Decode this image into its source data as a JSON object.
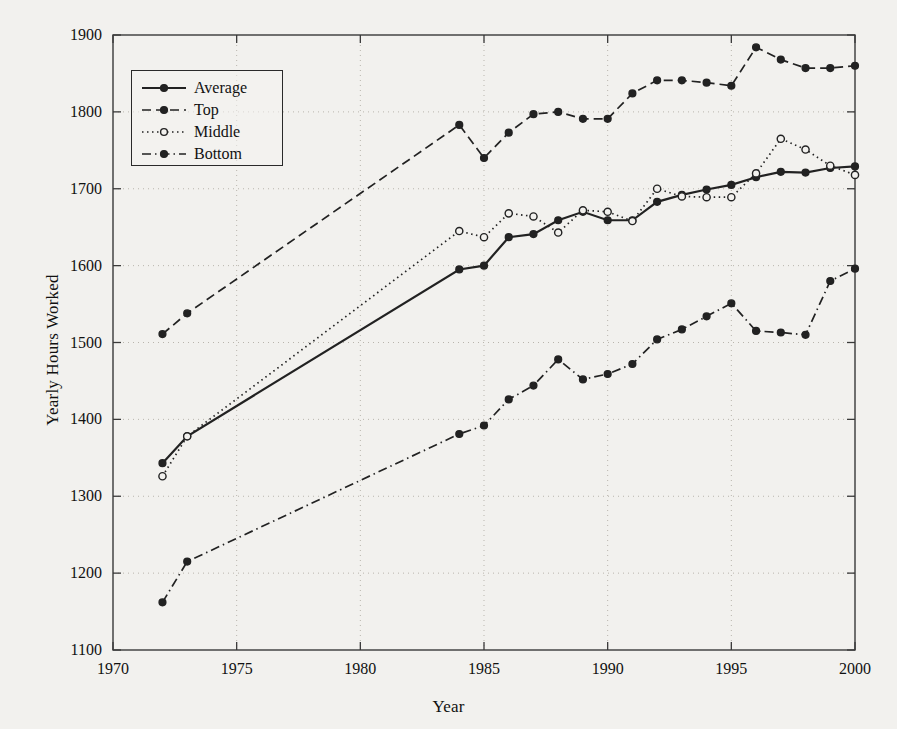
{
  "chart_data": {
    "type": "line",
    "title": "",
    "xlabel": "Year",
    "ylabel": "Yearly Hours Worked",
    "xlim": [
      1970,
      2000
    ],
    "ylim": [
      1100,
      1900
    ],
    "xticks": [
      1970,
      1975,
      1980,
      1985,
      1990,
      1995,
      2000
    ],
    "yticks": [
      1100,
      1200,
      1300,
      1400,
      1500,
      1600,
      1700,
      1800,
      1900
    ],
    "grid": true,
    "grid_style": "dotted",
    "legend_position": "upper left",
    "legend_entries": [
      "Average",
      "Top",
      "Middle",
      "Bottom"
    ],
    "background_color": "#f2f1ee",
    "line_color": "#222222",
    "series": [
      {
        "name": "Average",
        "linestyle": "solid",
        "marker": "filled-circle",
        "x": [
          1972,
          1973,
          1984,
          1985,
          1986,
          1987,
          1988,
          1989,
          1990,
          1991,
          1992,
          1993,
          1994,
          1995,
          1996,
          1997,
          1998,
          1999,
          2000
        ],
        "values": [
          1343,
          1378,
          1595,
          1600,
          1637,
          1641,
          1659,
          1670,
          1659,
          1659,
          1683,
          1692,
          1699,
          1705,
          1715,
          1722,
          1721,
          1727,
          1729
        ]
      },
      {
        "name": "Top",
        "linestyle": "dashed",
        "marker": "filled-circle",
        "x": [
          1972,
          1973,
          1984,
          1985,
          1986,
          1987,
          1988,
          1989,
          1990,
          1991,
          1992,
          1993,
          1994,
          1995,
          1996,
          1997,
          1998,
          1999,
          2000
        ],
        "values": [
          1511,
          1538,
          1783,
          1740,
          1773,
          1797,
          1800,
          1791,
          1791,
          1824,
          1841,
          1841,
          1838,
          1834,
          1884,
          1868,
          1857,
          1857,
          1860
        ]
      },
      {
        "name": "Middle",
        "linestyle": "dotted",
        "marker": "open-circle",
        "x": [
          1972,
          1973,
          1984,
          1985,
          1986,
          1987,
          1988,
          1989,
          1990,
          1991,
          1992,
          1993,
          1994,
          1995,
          1996,
          1997,
          1998,
          1999,
          2000
        ],
        "values": [
          1326,
          1378,
          1645,
          1637,
          1668,
          1664,
          1643,
          1672,
          1670,
          1658,
          1700,
          1690,
          1689,
          1689,
          1720,
          1765,
          1751,
          1730,
          1718
        ]
      },
      {
        "name": "Bottom",
        "linestyle": "dash-dot",
        "marker": "filled-circle",
        "x": [
          1972,
          1973,
          1984,
          1985,
          1986,
          1987,
          1988,
          1989,
          1990,
          1991,
          1992,
          1993,
          1994,
          1995,
          1996,
          1997,
          1998,
          1999,
          2000
        ],
        "values": [
          1162,
          1215,
          1381,
          1392,
          1426,
          1444,
          1478,
          1452,
          1459,
          1472,
          1504,
          1517,
          1534,
          1551,
          1515,
          1513,
          1510,
          1580,
          1596
        ]
      }
    ]
  },
  "axes": {
    "x_tick_labels": [
      "1970",
      "1975",
      "1980",
      "1985",
      "1990",
      "1995",
      "2000"
    ],
    "y_tick_labels": [
      "1100",
      "1200",
      "1300",
      "1400",
      "1500",
      "1600",
      "1700",
      "1800",
      "1900"
    ],
    "x_title": "Year",
    "y_title": "Yearly Hours Worked"
  },
  "legend": {
    "items": [
      {
        "label": "Average",
        "style": "solid"
      },
      {
        "label": "Top",
        "style": "dashed"
      },
      {
        "label": "Middle",
        "style": "dotted"
      },
      {
        "label": "Bottom",
        "style": "dash-dot"
      }
    ]
  }
}
